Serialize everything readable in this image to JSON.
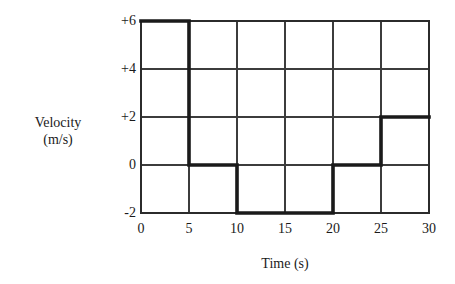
{
  "chart_data": {
    "type": "line",
    "title": "",
    "xlabel": "Time (s)",
    "ylabel": "Velocity (m/s)",
    "ylabel_line1": "Velocity",
    "ylabel_line2": "(m/s)",
    "xlim": [
      0,
      30
    ],
    "ylim": [
      -2,
      6
    ],
    "grid": true,
    "legend": false,
    "xticks": [
      0,
      5,
      10,
      15,
      20,
      25,
      30
    ],
    "xtick_labels": [
      "0",
      "5",
      "10",
      "15",
      "20",
      "25",
      "30"
    ],
    "yticks": [
      6,
      4,
      2,
      0,
      -2
    ],
    "ytick_labels": [
      "+6",
      "+4",
      "+2",
      "0",
      "-2"
    ],
    "series": [
      {
        "name": "velocity",
        "style": "step",
        "color": "#1a1a1a",
        "x": [
          0,
          5,
          5,
          10,
          10,
          20,
          20,
          25,
          25,
          30
        ],
        "y": [
          6,
          6,
          0,
          0,
          -2,
          -2,
          0,
          0,
          2,
          2
        ],
        "segments": [
          {
            "t_start": 0,
            "t_end": 5,
            "value": 6
          },
          {
            "t_start": 5,
            "t_end": 10,
            "value": 0
          },
          {
            "t_start": 10,
            "t_end": 20,
            "value": -2
          },
          {
            "t_start": 20,
            "t_end": 25,
            "value": 0
          },
          {
            "t_start": 25,
            "t_end": 30,
            "value": 2
          }
        ]
      }
    ]
  },
  "colors": {
    "background": "#ffffff",
    "grid": "#3c3c3c",
    "frame": "#2b2b2b",
    "curve": "#1a1a1a",
    "text": "#1a1a1a"
  }
}
